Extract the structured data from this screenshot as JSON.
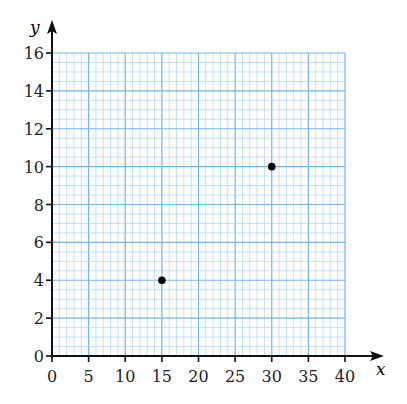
{
  "chart_data": {
    "type": "scatter",
    "title": "",
    "xlabel": "x",
    "ylabel": "y",
    "xlim": [
      0,
      40
    ],
    "ylim": [
      0,
      16
    ],
    "x_ticks": [
      0,
      5,
      10,
      15,
      20,
      25,
      30,
      35,
      40
    ],
    "y_ticks": [
      0,
      2,
      4,
      6,
      8,
      10,
      12,
      14,
      16
    ],
    "x_tick_labels": [
      "0",
      "5",
      "10",
      "15",
      "20",
      "25",
      "30",
      "35",
      "40"
    ],
    "y_tick_labels": [
      "0",
      "2",
      "4",
      "6",
      "8",
      "10",
      "12",
      "14",
      "16"
    ],
    "grid": true,
    "grid_minor_x_step": 1,
    "grid_minor_y_step": 0.5,
    "legend": null,
    "series": [
      {
        "name": "points",
        "points": [
          {
            "x": 15,
            "y": 4
          },
          {
            "x": 30,
            "y": 10
          }
        ]
      }
    ]
  },
  "colors": {
    "grid_minor": "#a8d4f0",
    "grid_major": "#6fb8e8",
    "axis": "#111111",
    "point": "#000000"
  }
}
